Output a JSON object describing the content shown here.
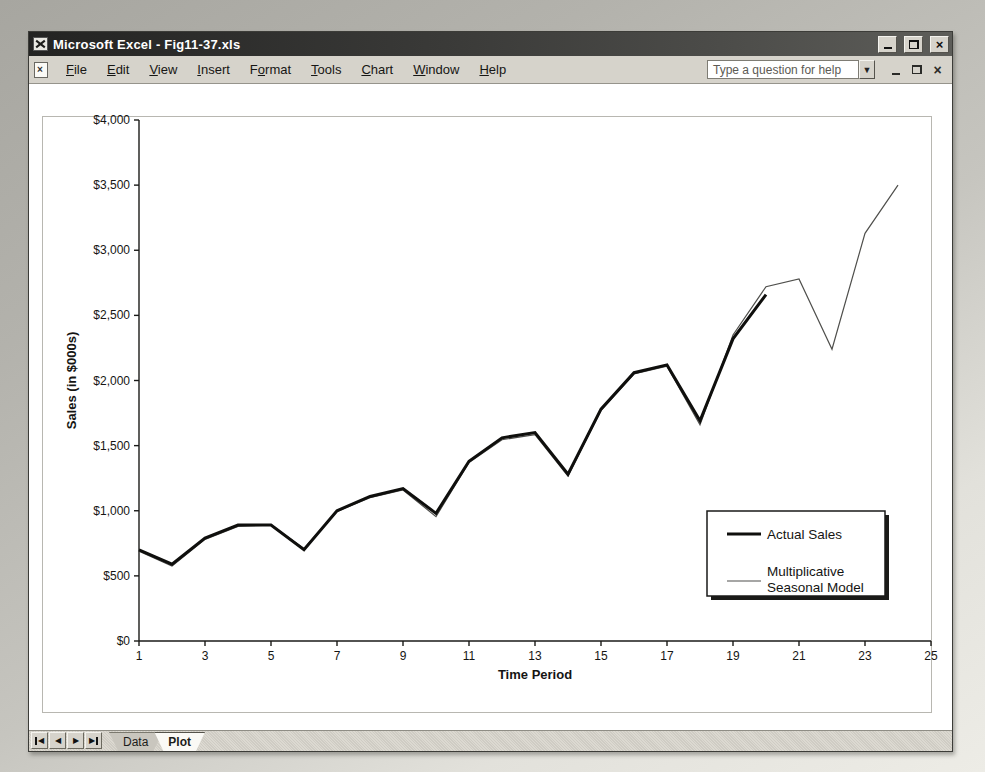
{
  "window": {
    "title": "Microsoft Excel - Fig11-37.xls",
    "app_icon": "excel-app-icon",
    "titlebar_controls": [
      "minimize",
      "restore",
      "close"
    ]
  },
  "menu": {
    "items": [
      {
        "label": "File",
        "underline": 0
      },
      {
        "label": "Edit",
        "underline": 0
      },
      {
        "label": "View",
        "underline": 0
      },
      {
        "label": "Insert",
        "underline": 0
      },
      {
        "label": "Format",
        "underline": 1
      },
      {
        "label": "Tools",
        "underline": 0
      },
      {
        "label": "Chart",
        "underline": 0
      },
      {
        "label": "Window",
        "underline": 0
      },
      {
        "label": "Help",
        "underline": 0
      }
    ],
    "help_placeholder": "Type a question for help",
    "document_controls": [
      "minimize",
      "restore",
      "close"
    ]
  },
  "sheet_bar": {
    "nav_buttons": [
      "first-sheet",
      "previous-sheet",
      "next-sheet",
      "last-sheet"
    ],
    "tabs": [
      {
        "label": "Data",
        "active": false
      },
      {
        "label": "Plot",
        "active": true
      }
    ]
  },
  "chart_data": {
    "type": "line",
    "title": "",
    "xlabel": "Time Period",
    "ylabel": "Sales (in $000s)",
    "xlim": [
      1,
      25
    ],
    "ylim": [
      0,
      4000
    ],
    "x_ticks": [
      1,
      3,
      5,
      7,
      9,
      11,
      13,
      15,
      17,
      19,
      21,
      23,
      25
    ],
    "y_ticks": [
      0,
      500,
      1000,
      1500,
      2000,
      2500,
      3000,
      3500,
      4000
    ],
    "y_tick_labels": [
      "$0",
      "$500",
      "$1,000",
      "$1,500",
      "$2,000",
      "$2,500",
      "$3,000",
      "$3,500",
      "$4,000"
    ],
    "grid": false,
    "series": [
      {
        "name": "Actual Sales",
        "line": "thick-black",
        "periods": [
          1,
          2,
          3,
          4,
          5,
          6,
          7,
          8,
          9,
          10,
          11,
          12,
          13,
          14,
          15,
          16,
          17,
          18,
          19,
          20
        ],
        "values": [
          700,
          590,
          790,
          890,
          890,
          700,
          1000,
          1110,
          1170,
          980,
          1380,
          1560,
          1600,
          1280,
          1780,
          2060,
          2120,
          1690,
          2320,
          2660
        ]
      },
      {
        "name": "Multiplicative Seasonal Model",
        "line": "thin-gray",
        "periods": [
          1,
          2,
          3,
          4,
          5,
          6,
          7,
          8,
          9,
          10,
          11,
          12,
          13,
          14,
          15,
          16,
          17,
          18,
          19,
          20,
          21,
          22,
          23,
          24
        ],
        "values": [
          690,
          575,
          780,
          880,
          890,
          710,
          995,
          1100,
          1160,
          955,
          1370,
          1545,
          1585,
          1265,
          1770,
          2050,
          2110,
          1660,
          2350,
          2720,
          2780,
          2240,
          3130,
          3500
        ]
      }
    ],
    "legend": {
      "position": "inside-right",
      "entries": [
        {
          "name": "Actual Sales",
          "lines": [
            "Actual Sales"
          ]
        },
        {
          "name": "Multiplicative Seasonal Model",
          "lines": [
            "Multiplicative",
            "Seasonal Model"
          ]
        }
      ]
    }
  }
}
